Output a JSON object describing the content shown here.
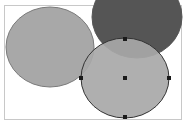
{
  "canvas": {
    "frame": {
      "x": 4,
      "y": 5,
      "w": 178,
      "h": 115,
      "stroke": "#c8c8c8"
    },
    "shapes": [
      {
        "id": "ellipse-left",
        "cx": 50,
        "cy": 47,
        "rx": 44,
        "ry": 40,
        "fill": "#a8a8a8",
        "stroke": "#7a7a7a"
      },
      {
        "id": "ellipse-dark",
        "cx": 137,
        "cy": 17,
        "rx": 45,
        "ry": 41,
        "fill": "#555555",
        "stroke": "#555555"
      },
      {
        "id": "ellipse-selected",
        "cx": 125,
        "cy": 78,
        "rx": 44,
        "ry": 40,
        "fill": "#a8a8a8",
        "stroke": "#333333",
        "opacity": 0.92
      }
    ],
    "handles": [
      {
        "x": 125,
        "y": 39
      },
      {
        "x": 81,
        "y": 78
      },
      {
        "x": 125,
        "y": 78
      },
      {
        "x": 169,
        "y": 78
      },
      {
        "x": 125,
        "y": 117
      }
    ],
    "handle_color": "#1a1a1a"
  }
}
